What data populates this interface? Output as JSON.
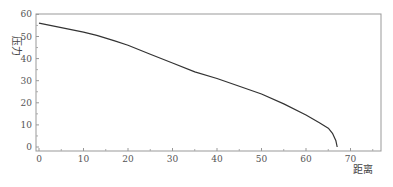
{
  "chart_data": {
    "type": "line",
    "title": "",
    "xlabel": "距离",
    "ylabel": "压力",
    "xlim": [
      0,
      76
    ],
    "ylim": [
      -1,
      61
    ],
    "x_ticks": [
      0,
      10,
      20,
      30,
      40,
      50,
      60,
      70
    ],
    "y_ticks": [
      0,
      10,
      20,
      30,
      40,
      50,
      60
    ],
    "grid": false,
    "legend": null,
    "series": [
      {
        "name": "压力",
        "color": "#333333",
        "x": [
          0,
          5,
          10,
          13,
          17,
          20,
          25,
          30,
          35,
          40,
          45,
          50,
          55,
          60,
          63,
          65,
          66,
          66.7,
          67
        ],
        "y": [
          56,
          54,
          52,
          50.5,
          48,
          46,
          42,
          38,
          34,
          31,
          27.5,
          24,
          19.5,
          14.5,
          11,
          8.5,
          6,
          3,
          0
        ]
      }
    ]
  }
}
